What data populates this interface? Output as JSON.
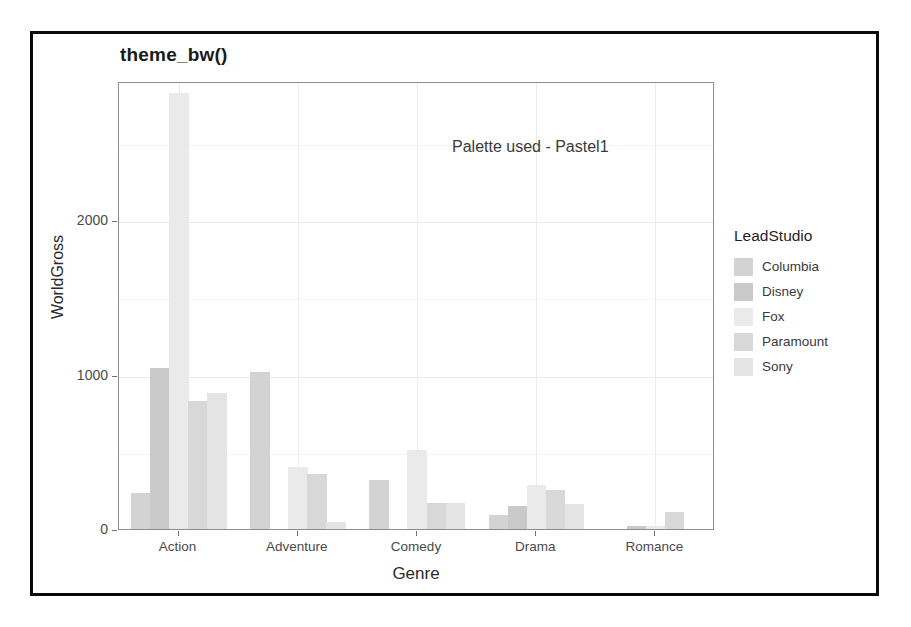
{
  "figure": {
    "title": "theme_bw()",
    "annotation": "Palette used - Pastel1"
  },
  "legend": {
    "title": "LeadStudio",
    "items": [
      {
        "label": "Columbia",
        "color": "#d3d3d3"
      },
      {
        "label": "Disney",
        "color": "#c9c9c9"
      },
      {
        "label": "Fox",
        "color": "#eaeaea"
      },
      {
        "label": "Paramount",
        "color": "#d8d8d8"
      },
      {
        "label": "Sony",
        "color": "#e4e4e4"
      }
    ]
  },
  "chart_data": {
    "type": "bar",
    "title": "theme_bw()",
    "xlabel": "Genre",
    "ylabel": "WorldGross",
    "categories": [
      "Action",
      "Adventure",
      "Comedy",
      "Drama",
      "Romance"
    ],
    "ylim": [
      0,
      2900
    ],
    "yticks": [
      0,
      1000,
      2000
    ],
    "ytick_labels": [
      "0",
      "1000",
      "2000"
    ],
    "grid": true,
    "legend_position": "right",
    "legend_title": "LeadStudio",
    "annotations": [
      "Palette used - Pastel1"
    ],
    "series": [
      {
        "name": "Columbia",
        "color": "#d3d3d3",
        "values": [
          230,
          1015,
          315,
          90,
          0
        ]
      },
      {
        "name": "Disney",
        "color": "#c9c9c9",
        "values": [
          1040,
          0,
          0,
          150,
          20
        ]
      },
      {
        "name": "Fox",
        "color": "#eaeaea",
        "values": [
          2820,
          400,
          510,
          285,
          20
        ]
      },
      {
        "name": "Paramount",
        "color": "#d8d8d8",
        "values": [
          830,
          355,
          170,
          250,
          110
        ]
      },
      {
        "name": "Sony",
        "color": "#e4e4e4",
        "values": [
          880,
          45,
          170,
          165,
          0
        ]
      }
    ]
  },
  "axes": {
    "y_title": "WorldGross",
    "x_title": "Genre",
    "y_tick_labels": [
      "2000",
      "1000",
      "0"
    ],
    "x_tick_labels": [
      "Action",
      "Adventure",
      "Comedy",
      "Drama",
      "Romance"
    ]
  }
}
